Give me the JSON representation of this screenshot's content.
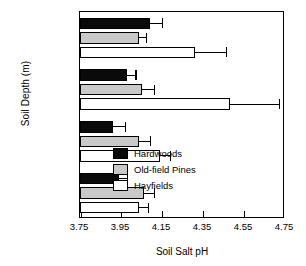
{
  "chart_data": {
    "type": "bar",
    "orientation": "horizontal",
    "title": "",
    "xlabel": "Soil Salt pH",
    "ylabel": "Soil Depth (m)",
    "xlim": [
      3.75,
      4.75
    ],
    "xticks": [
      "3.75",
      "3.95",
      "4.15",
      "4.35",
      "4.55",
      "4.75"
    ],
    "xtick_values": [
      3.75,
      3.95,
      4.15,
      4.35,
      4.55,
      4.75
    ],
    "grid": false,
    "legend_position": "inside-lower-right",
    "categories": [
      "0-0.3",
      "0.3-0.55",
      "0.55-0.875",
      "0.875-1.1"
    ],
    "series": [
      {
        "name": "Hardwoods",
        "color": "#0a0a0a",
        "values": [
          4.09,
          3.98,
          3.91,
          3.94
        ],
        "errors": [
          0.06,
          0.04,
          0.06,
          0.04
        ]
      },
      {
        "name": "Old-field Pines",
        "color": "#c9c9c9",
        "values": [
          4.04,
          4.05,
          4.04,
          4.06
        ],
        "errors": [
          0.03,
          0.06,
          0.05,
          0.05
        ]
      },
      {
        "name": "Hayfields",
        "color": "#ffffff",
        "values": [
          4.31,
          4.48,
          4.14,
          4.04
        ],
        "errors": [
          0.15,
          0.24,
          0.05,
          0.04
        ]
      }
    ]
  },
  "legend": {
    "items": [
      {
        "label": "Hardwoods"
      },
      {
        "label": "Old-field Pines"
      },
      {
        "label": "Hayfields"
      }
    ]
  }
}
